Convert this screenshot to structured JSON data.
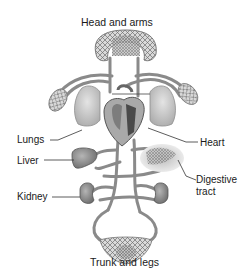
{
  "diagram": {
    "labels": {
      "head_and_arms": "Head and arms",
      "lungs": "Lungs",
      "heart": "Heart",
      "liver": "Liver",
      "digestive_tract_line1": "Digestive",
      "digestive_tract_line2": "tract",
      "kidney": "Kidney",
      "trunk_and_legs": "Trunk and legs"
    },
    "colors": {
      "vessel": "#8a8a8a",
      "vessel_dark": "#5e5e5e",
      "organ_fill": "#9c9c9c",
      "lung_fill": "#c9c9c9",
      "capillary": "#6f6f6f",
      "leader_line": "#333333",
      "text": "#1a1a1a"
    }
  }
}
